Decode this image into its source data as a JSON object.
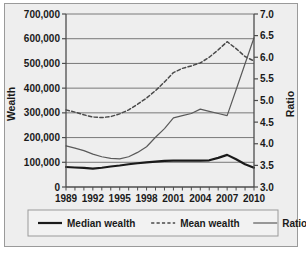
{
  "chart_data": {
    "type": "line",
    "title": "",
    "xlabel": "",
    "ylabel": "Wealth",
    "y2label": "Ratio",
    "grid": true,
    "legend_position": "bottom",
    "x": [
      1989,
      1990,
      1991,
      1992,
      1993,
      1994,
      1995,
      1996,
      1997,
      1998,
      1999,
      2000,
      2001,
      2002,
      2003,
      2004,
      2005,
      2006,
      2007,
      2008,
      2009,
      2010
    ],
    "xticklabels": [
      "1989",
      "1992",
      "1995",
      "1998",
      "2001",
      "2004",
      "2007",
      "2010"
    ],
    "xtick_values": [
      1989,
      1992,
      1995,
      1998,
      2001,
      2004,
      2007,
      2010
    ],
    "xlim": [
      1989,
      2010
    ],
    "ylim": [
      0,
      700000
    ],
    "yticklabels": [
      "0",
      "100,000",
      "200,000",
      "300,000",
      "400,000",
      "500,000",
      "600,000",
      "700,000"
    ],
    "ytick_values": [
      0,
      100000,
      200000,
      300000,
      400000,
      500000,
      600000,
      700000
    ],
    "y2lim": [
      3.0,
      7.0
    ],
    "y2ticklabels": [
      "3.0",
      "3.5",
      "4.0",
      "4.5",
      "5.0",
      "5.5",
      "6.0",
      "6.5",
      "7.0"
    ],
    "y2tick_values": [
      3.0,
      3.5,
      4.0,
      4.5,
      5.0,
      5.5,
      6.0,
      6.5,
      7.0
    ],
    "series": [
      {
        "name": "Median wealth",
        "axis": "left",
        "style": "solid-thick",
        "color": "#1a1a1a",
        "values": [
          81000,
          79000,
          77000,
          74000,
          78000,
          83000,
          87000,
          92000,
          96000,
          100000,
          103000,
          106000,
          107000,
          107000,
          107000,
          107000,
          108000,
          118000,
          130000,
          112000,
          92000,
          78000
        ]
      },
      {
        "name": "Mean wealth",
        "axis": "left",
        "style": "dashed",
        "color": "#4a4a4a",
        "values": [
          312000,
          303000,
          292000,
          283000,
          281000,
          285000,
          296000,
          312000,
          335000,
          360000,
          390000,
          425000,
          463000,
          480000,
          490000,
          502000,
          525000,
          555000,
          588000,
          560000,
          528000,
          510000
        ]
      },
      {
        "name": "Ratio",
        "axis": "right",
        "style": "solid-thin",
        "color": "#5a5a5a",
        "values": [
          3.95,
          3.9,
          3.84,
          3.76,
          3.7,
          3.66,
          3.65,
          3.7,
          3.8,
          3.93,
          4.15,
          4.35,
          4.6,
          4.65,
          4.7,
          4.8,
          4.75,
          4.7,
          4.65,
          5.25,
          5.85,
          6.45
        ]
      }
    ]
  },
  "legend": {
    "items": [
      {
        "label": "Median wealth",
        "style": "solid-thick"
      },
      {
        "label": "Mean wealth",
        "style": "dashed"
      },
      {
        "label": "Ratio",
        "style": "solid-thin"
      }
    ]
  },
  "colors": {
    "background": "#eeeeee",
    "frame_border": "#9a9a9a",
    "axis": "#4d4d4d",
    "grid": "#6b6b6b",
    "text": "#1a1a1a"
  }
}
